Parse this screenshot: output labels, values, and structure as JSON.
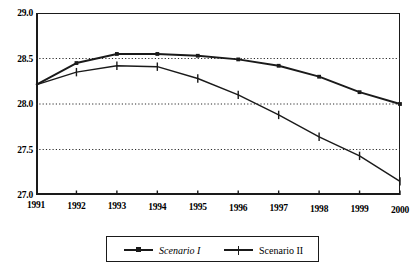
{
  "chart_data": {
    "type": "line",
    "title": "",
    "xlabel": "",
    "ylabel": "",
    "x": [
      1991,
      1992,
      1993,
      1994,
      1995,
      1996,
      1997,
      1998,
      1999,
      2000
    ],
    "xticklabels": [
      "1991",
      "1992",
      "1993",
      "1994",
      "1995",
      "1996",
      "1997",
      "1998",
      "1999",
      "2000"
    ],
    "yticklabels": [
      "29.0",
      "28.5",
      "28.0",
      "27.5",
      "27.0"
    ],
    "yticks": [
      29.0,
      28.5,
      28.0,
      27.5,
      27.0
    ],
    "xlim": [
      1991,
      2000
    ],
    "ylim": [
      27.0,
      29.0
    ],
    "grid": "horizontal-dotted",
    "gridlines": [
      28.5,
      28.0,
      27.5
    ],
    "legend_position": "below-center",
    "series": [
      {
        "name": "Scenario I",
        "marker": "square",
        "color": "#1a1a1a",
        "values": [
          28.21,
          28.45,
          28.55,
          28.55,
          28.53,
          28.49,
          28.42,
          28.3,
          28.13,
          28.0
        ]
      },
      {
        "name": "Scenario II",
        "marker": "plus",
        "color": "#1a1a1a",
        "values": [
          28.21,
          28.35,
          28.42,
          28.41,
          28.28,
          28.1,
          27.88,
          27.64,
          27.43,
          27.15
        ]
      }
    ]
  },
  "legend": {
    "items": [
      {
        "label": "Scenario I"
      },
      {
        "label": "Scenario II"
      }
    ]
  },
  "axes": {
    "y_labels": [
      "29.0",
      "28.5",
      "28.0",
      "27.5",
      "27.0"
    ],
    "x_labels": [
      "1991",
      "1992",
      "1993",
      "1994",
      "1995",
      "1996",
      "1997",
      "1998",
      "1999",
      "2000"
    ]
  }
}
